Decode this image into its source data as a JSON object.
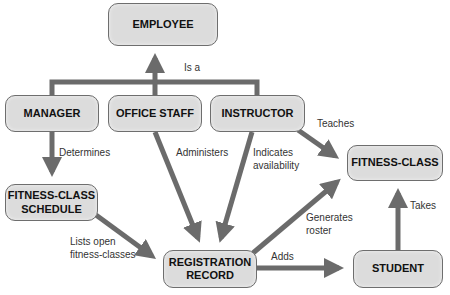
{
  "diagram": {
    "nodes": {
      "employee": "EMPLOYEE",
      "manager": "MANAGER",
      "office_staff": "OFFICE STAFF",
      "instructor": "INSTRUCTOR",
      "fitness_class": "FITNESS-CLASS",
      "schedule_line1": "FITNESS-CLASS",
      "schedule_line2": "SCHEDULE",
      "registration_line1": "REGISTRATION",
      "registration_line2": "RECORD",
      "student": "STUDENT"
    },
    "edges": {
      "is_a": "Is a",
      "determines": "Determines",
      "administers": "Administers",
      "indicates_line1": "Indicates",
      "indicates_line2": "availability",
      "teaches": "Teaches",
      "lists_line1": "Lists open",
      "lists_line2": "fitness-classes",
      "generates_line1": "Generates",
      "generates_line2": "roster",
      "adds": "Adds",
      "takes": "Takes"
    },
    "colors": {
      "node_fill": "#dcdcdc",
      "node_border": "#6e6e6e",
      "arrow": "#6b6b6b"
    }
  }
}
